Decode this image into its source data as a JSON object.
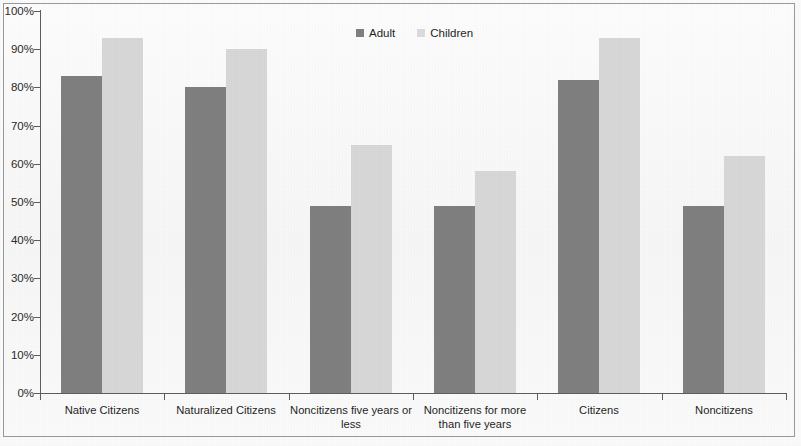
{
  "chart_data": {
    "type": "bar",
    "title": "",
    "xlabel": "",
    "ylabel": "",
    "ylim": [
      0,
      100
    ],
    "ytick_labels": [
      "100%",
      "90%",
      "80%",
      "70%",
      "60%",
      "50%",
      "40%",
      "30%",
      "20%",
      "10%",
      "0%"
    ],
    "ytick_values": [
      100,
      90,
      80,
      70,
      60,
      50,
      40,
      30,
      20,
      10,
      0
    ],
    "grid": false,
    "legend_position": "top-center",
    "categories": [
      "Native Citizens",
      "Naturalized Citizens",
      "Noncitizens five years or less",
      "Noncitizens for more than five years",
      "Citizens",
      "Noncitizens"
    ],
    "series": [
      {
        "name": "Adult",
        "color": "#808080",
        "values": [
          83,
          80,
          49,
          49,
          82,
          49
        ]
      },
      {
        "name": "Children",
        "color": "#d8d8d8",
        "values": [
          93,
          90,
          65,
          58,
          93,
          62
        ]
      }
    ]
  },
  "legend": {
    "entries": [
      {
        "label": "Adult",
        "swatch": "legend-swatch-adult"
      },
      {
        "label": "Children",
        "swatch": "legend-swatch-children"
      }
    ]
  },
  "axis": {
    "y_axis_name": "y-axis",
    "x_axis_name": "x-axis"
  }
}
